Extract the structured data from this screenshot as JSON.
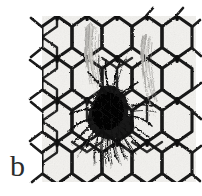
{
  "figure": {
    "panel_label": "b",
    "caption_text": "",
    "media_type": "scanned black-and-white photograph",
    "colors": {
      "page_background": "#ffffff",
      "photo_background": "#f2f1ee",
      "wire_dark": "#131313",
      "wire_mid": "#3a3a3a",
      "hair_tangle_dark": "#0c0c0c",
      "hair_wisp_gray": "#9a9a98",
      "fuzz_band_light": "#c9c8c4",
      "label_color": "#2b2b2b"
    },
    "dimensions": {
      "width_px": 202,
      "height_px": 196
    }
  },
  "photo": {
    "region": {
      "left": 42,
      "top": 16,
      "right": 196,
      "bottom": 182
    },
    "mesh": {
      "pattern": "hexagonal chicken wire",
      "cell_width_px": 30,
      "cell_height_px": 42,
      "columns": 6,
      "rows": 5,
      "orientation": "vertical hexagons"
    },
    "features": [
      {
        "name": "central-hair-tangle",
        "description": "dense dark mass of tangled hair fibers snagged on the wire",
        "center_x": 112,
        "center_y": 114,
        "width_px": 64,
        "height_px": 58
      },
      {
        "name": "left-fuzz-band",
        "description": "light gray fuzzy band of hair along a vertical wire strand",
        "center_x": 95,
        "center_y": 64,
        "width_px": 20,
        "height_px": 82
      },
      {
        "name": "right-fuzz-band",
        "description": "light gray fuzzy band of hair along a vertical wire strand",
        "center_x": 147,
        "center_y": 74,
        "width_px": 18,
        "height_px": 84
      },
      {
        "name": "lower-wisp-fringe",
        "description": "fine hair strands hanging downward below the tangle",
        "center_x": 112,
        "center_y": 146,
        "width_px": 60,
        "height_px": 26
      }
    ]
  }
}
